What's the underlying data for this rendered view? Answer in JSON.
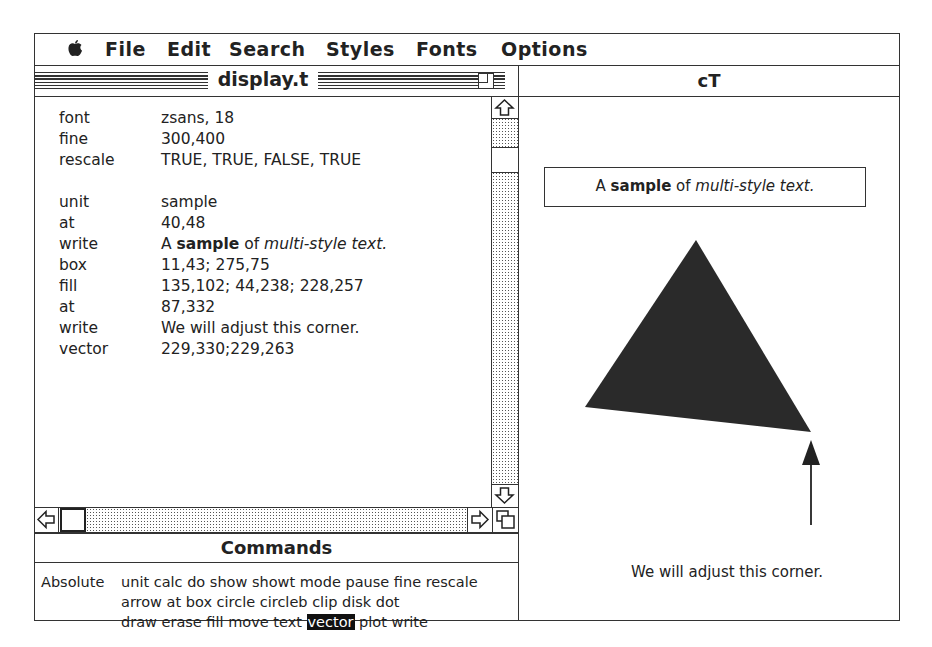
{
  "menubar": {
    "apple_icon": "apple-icon",
    "items": [
      "File",
      "Edit",
      "Search",
      "Styles",
      "Fonts",
      "Options"
    ]
  },
  "editor_window": {
    "title": "display.t",
    "lines": [
      {
        "key": "font",
        "value": "zsans, 18"
      },
      {
        "key": "fine",
        "value": "300,400"
      },
      {
        "key": "rescale",
        "value": "TRUE, TRUE, FALSE, TRUE"
      },
      {
        "key": "",
        "value": ""
      },
      {
        "key": "unit",
        "value": "sample"
      },
      {
        "key": "at",
        "value": "40,48"
      },
      {
        "key": "write",
        "value_parts": [
          {
            "text": "A ",
            "style": "plain"
          },
          {
            "text": "sample",
            "style": "bold"
          },
          {
            "text": " of ",
            "style": "plain"
          },
          {
            "text": "multi-style text.",
            "style": "italic"
          }
        ]
      },
      {
        "key": "box",
        "value": "11,43; 275,75"
      },
      {
        "key": "fill",
        "value": "135,102; 44,238; 228,257"
      },
      {
        "key": "at",
        "value": "87,332"
      },
      {
        "key": "write",
        "value": "We will adjust this corner."
      },
      {
        "key": "vector",
        "value": "229,330;229,263"
      }
    ]
  },
  "commands_panel": {
    "title": "Commands",
    "mode_label": "Absolute",
    "lines": [
      "unit calc do show showt mode pause fine rescale",
      "arrow at box circle circleb clip disk dot",
      "draw erase fill move text"
    ],
    "selected": "vector",
    "line3_after": " plot write"
  },
  "output_window": {
    "title": "cT",
    "sample_text": {
      "a": "A ",
      "bold": "sample",
      "of": " of ",
      "italic": "multi-style text."
    },
    "corner_label": "We will adjust this corner.",
    "triangle_fill": "#2a2a2a"
  }
}
